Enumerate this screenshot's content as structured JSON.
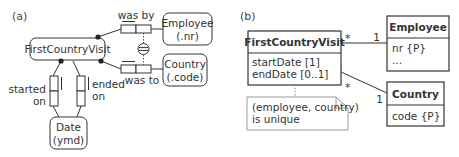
{
  "panel_a": {
    "label": "(a)",
    "entities": {
      "first_country_visit": {
        "name": "FirstCountryVisit"
      },
      "employee": {
        "name": "Employee",
        "ref": "(.nr)"
      },
      "country": {
        "name": "Country",
        "ref": "(.code)"
      },
      "date": {
        "name": "Date",
        "ref": "(ymd)"
      }
    },
    "fact_types": {
      "was_by": "was by",
      "was_to": "was to",
      "started_on": {
        "line1": "started",
        "line2": "on"
      },
      "ended_on": {
        "line1": "ended",
        "line2": "on"
      }
    },
    "constraints": {
      "external_uniqueness_symbol": "circled-double-bar"
    }
  },
  "panel_b": {
    "label": "(b)",
    "classes": {
      "first_country_visit": {
        "name": "FirstCountryVisit",
        "attributes": [
          "startDate [1]",
          "endDate [0..1]"
        ]
      },
      "employee": {
        "name": "Employee",
        "attributes": [
          "nr {P}",
          "..."
        ]
      },
      "country": {
        "name": "Country",
        "attributes": [
          "code {P}"
        ]
      }
    },
    "associations": {
      "fcv_employee": {
        "source_mult": "*",
        "target_mult": "1"
      },
      "fcv_country": {
        "source_mult": "*",
        "target_mult": "1"
      }
    },
    "note": {
      "line1": "(employee, country)",
      "line2": "is unique"
    }
  },
  "colors": {
    "stroke": "#333333",
    "note_stroke": "#999999",
    "text": "#333333"
  }
}
